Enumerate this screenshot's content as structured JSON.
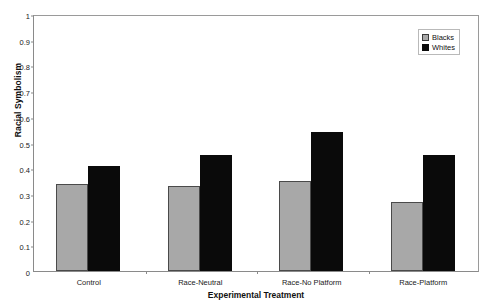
{
  "chart_data": {
    "type": "bar",
    "title": "",
    "xlabel": "Experimental Treatment",
    "ylabel": "Racial Symbolism",
    "categories": [
      "Control",
      "Race-Neutral",
      "Race-No Platform",
      "Race-Platform"
    ],
    "series": [
      {
        "name": "Blacks",
        "color": "#a8a8a8",
        "values": [
          0.34,
          0.33,
          0.35,
          0.27
        ]
      },
      {
        "name": "Whites",
        "color": "#0a0a0a",
        "values": [
          0.41,
          0.45,
          0.54,
          0.45
        ]
      }
    ],
    "ylim": [
      0,
      1
    ],
    "ytick_labels": [
      "0",
      "0.1",
      "0.2",
      "0.3",
      "0.4",
      "0.5",
      "0.6",
      "0.7",
      "0.8",
      "0.9",
      "1"
    ],
    "ytick_values": [
      0,
      0.1,
      0.2,
      0.3,
      0.4,
      0.5,
      0.6,
      0.7,
      0.8,
      0.9,
      1
    ],
    "grid": false,
    "legend_position": "top-right",
    "legend_entries": [
      "Blacks",
      "Whites"
    ]
  }
}
